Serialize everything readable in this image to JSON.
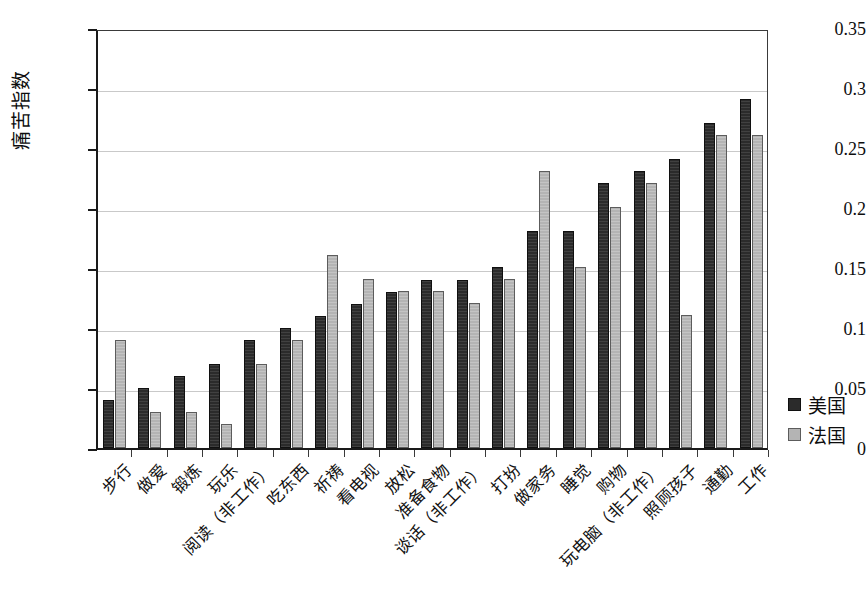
{
  "chart_data": {
    "type": "bar",
    "title": "",
    "xlabel": "",
    "ylabel": "痛苦指数",
    "ylim": [
      0,
      0.35
    ],
    "yticks": [
      "0",
      "0.05",
      "0.1",
      "0.15",
      "0.2",
      "0.25",
      "0.3",
      "0.35"
    ],
    "ytick_values": [
      0,
      0.05,
      0.1,
      0.15,
      0.2,
      0.25,
      0.3,
      0.35
    ],
    "grid": true,
    "legend_position": "right",
    "categories": [
      "步行",
      "做爱",
      "锻炼",
      "玩乐",
      "阅读（非工作）",
      "吃东西",
      "祈祷",
      "看电视",
      "放松",
      "准备食物",
      "谈话（非工作）",
      "打扮",
      "做家务",
      "睡觉",
      "购物",
      "玩电脑（非工作）",
      "照顾孩子",
      "通勤",
      "工作"
    ],
    "series": [
      {
        "name": "美国",
        "color": "#2b2b2b",
        "values": [
          0.04,
          0.05,
          0.06,
          0.07,
          0.09,
          0.1,
          0.11,
          0.12,
          0.13,
          0.14,
          0.14,
          0.151,
          0.181,
          0.181,
          0.221,
          0.231,
          0.241,
          0.271,
          0.291
        ]
      },
      {
        "name": "法国",
        "color": "#b4b4b4",
        "values": [
          0.09,
          0.03,
          0.03,
          0.02,
          0.07,
          0.09,
          0.161,
          0.141,
          0.131,
          0.131,
          0.121,
          0.141,
          0.231,
          0.151,
          0.201,
          0.221,
          0.111,
          0.261,
          0.261
        ]
      }
    ]
  },
  "legend": {
    "items": [
      {
        "label": "美国"
      },
      {
        "label": "法国"
      }
    ]
  }
}
